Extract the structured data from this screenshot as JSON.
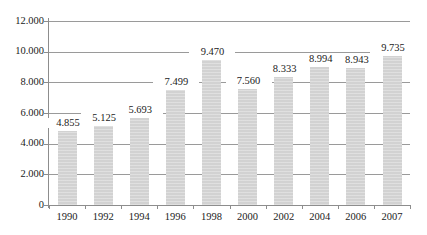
{
  "chart_data": {
    "type": "bar",
    "title": "",
    "subtitle": "",
    "xlabel": "",
    "ylabel": "",
    "categories": [
      "1990",
      "1992",
      "1994",
      "1996",
      "1998",
      "2000",
      "2002",
      "2004",
      "2006",
      "2007"
    ],
    "values": [
      4855,
      5125,
      5693,
      7499,
      9470,
      7560,
      8333,
      8994,
      8943,
      9735
    ],
    "value_labels": [
      "4.855",
      "5.125",
      "5.693",
      "7.499",
      "9.470",
      "7.560",
      "8.333",
      "8.994",
      "8.943",
      "9.735"
    ],
    "ylim": [
      0,
      12000
    ],
    "ytick_values": [
      0,
      2000,
      4000,
      6000,
      8000,
      10000,
      12000
    ],
    "ytick_labels": [
      "0",
      "2.000",
      "4.000",
      "6.000",
      "8.000",
      "10.000",
      "12.000"
    ],
    "grid": true,
    "grid_axis": "y",
    "legend": false,
    "legend_position": "none",
    "series": [
      {
        "name": "",
        "values": [
          4855,
          5125,
          5693,
          7499,
          9470,
          7560,
          8333,
          8994,
          8943,
          9735
        ]
      }
    ],
    "colors": {
      "bar_fill": "#d2d2d2",
      "gridline": "#9a9a9a",
      "axis_line": "#8d8d8d",
      "text": "#1b1b1b",
      "background": "#ffffff"
    }
  }
}
